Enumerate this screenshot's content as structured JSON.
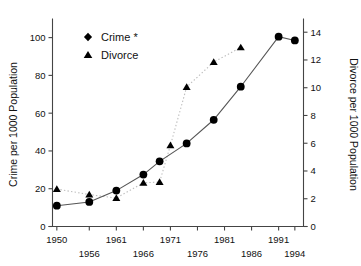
{
  "chart_data": {
    "type": "line",
    "title": "",
    "xlabel": "",
    "ylabel": "Crime per 1000 Population",
    "y2label": "Divorce per 1000 Population",
    "grid": false,
    "legend_position": "top-left",
    "x": [
      1950,
      1956,
      1961,
      1966,
      1971,
      1976,
      1981,
      1986,
      1991,
      1994
    ],
    "xtick_labels_top": [
      "1950",
      "1961",
      "1971",
      "1981",
      "1991"
    ],
    "xtick_labels_bottom": [
      "1956",
      "1966",
      "1976",
      "1986",
      "1994"
    ],
    "xtick_values": [
      1950,
      1956,
      1961,
      1966,
      1971,
      1976,
      1981,
      1986,
      1991,
      1994
    ],
    "ylim": [
      0,
      108
    ],
    "ytick_values": [
      0,
      20,
      40,
      60,
      80,
      100
    ],
    "ytick_labels": [
      "0",
      "20",
      "40",
      "60",
      "80",
      "100"
    ],
    "y2lim": [
      0,
      14.7
    ],
    "y2tick_values": [
      0,
      2,
      4,
      6,
      8,
      10,
      12,
      14
    ],
    "y2tick_labels": [
      "0",
      "2",
      "4",
      "6",
      "8",
      "10",
      "12",
      "14"
    ],
    "series": [
      {
        "name": "Crime *",
        "axis": "left",
        "marker": "diamond",
        "linestyle": "solid",
        "color": "#000000",
        "x": [
          1950,
          1954,
          1956,
          1961,
          1964,
          1966,
          1969,
          1971,
          1974,
          1976,
          1981,
          1984,
          1986,
          1991,
          1994
        ],
        "values": [
          11,
          13,
          13,
          19,
          19,
          27.5,
          34.5,
          34.5,
          44,
          44,
          56.5,
          56.5,
          74,
          100.5,
          98.5
        ]
      },
      {
        "name": "Divorce",
        "axis": "right",
        "marker": "triangle",
        "linestyle": "dotted",
        "color": "#000000",
        "x": [
          1950,
          1956,
          1961,
          1966,
          1969,
          1971,
          1976,
          1981,
          1986
        ],
        "values": [
          2.7,
          2.3,
          2.1,
          3.2,
          3.2,
          5.9,
          10.1,
          11.9,
          12.9
        ]
      }
    ],
    "crime_points": [
      {
        "x": 1950,
        "y": 11
      },
      {
        "x": 1956,
        "y": 13
      },
      {
        "x": 1961,
        "y": 19
      },
      {
        "x": 1966,
        "y": 27.5
      },
      {
        "x": 1969,
        "y": 34.5
      },
      {
        "x": 1974,
        "y": 44
      },
      {
        "x": 1979,
        "y": 56.5
      },
      {
        "x": 1984,
        "y": 74
      },
      {
        "x": 1991,
        "y": 100.5
      },
      {
        "x": 1994,
        "y": 98.5
      }
    ],
    "divorce_points": [
      {
        "x": 1950,
        "y": 2.7
      },
      {
        "x": 1956,
        "y": 2.3
      },
      {
        "x": 1961,
        "y": 2.05
      },
      {
        "x": 1966,
        "y": 3.15
      },
      {
        "x": 1969,
        "y": 3.2
      },
      {
        "x": 1971,
        "y": 5.85
      },
      {
        "x": 1974,
        "y": 10.05
      },
      {
        "x": 1979,
        "y": 11.85
      },
      {
        "x": 1984,
        "y": 12.9
      }
    ]
  },
  "legend": {
    "items": [
      {
        "label": "Crime *",
        "marker": "diamond"
      },
      {
        "label": "Divorce",
        "marker": "triangle"
      }
    ]
  },
  "axes": {
    "left_title": "Crime per 1000 Population",
    "right_title": "Divorce per 1000 Population"
  }
}
